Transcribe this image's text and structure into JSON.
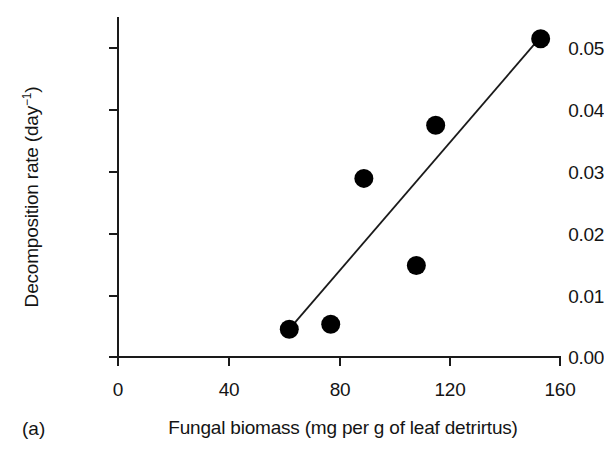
{
  "figure": {
    "panel_label": "(a)",
    "ylabel_text": "Decomposition rate (day",
    "ylabel_exponent": "−1",
    "ylabel_close": ")",
    "xlabel": "Fungal biomass (mg per g of leaf detrirtus)"
  },
  "chart_data": {
    "type": "scatter",
    "title": "",
    "xlabel": "Fungal biomass (mg per g of leaf detrirtus)",
    "ylabel": "Decomposition rate (day−1)",
    "xlim": [
      0,
      160
    ],
    "ylim": [
      0.0,
      0.05
    ],
    "xticks": [
      0,
      40,
      80,
      120,
      160
    ],
    "yticks": [
      0.0,
      0.01,
      0.02,
      0.03,
      0.04,
      0.05
    ],
    "xtick_labels": [
      "0",
      "40",
      "80",
      "120",
      "160"
    ],
    "ytick_labels": [
      "0.00",
      "0.01",
      "0.02",
      "0.03",
      "0.04",
      "0.05"
    ],
    "grid": false,
    "legend": "none",
    "marker": "filled-circle",
    "marker_color": "#000000",
    "points": [
      {
        "x": 62,
        "y": 0.0045
      },
      {
        "x": 77,
        "y": 0.0053
      },
      {
        "x": 89,
        "y": 0.0289
      },
      {
        "x": 108,
        "y": 0.0148
      },
      {
        "x": 115,
        "y": 0.0375
      },
      {
        "x": 153,
        "y": 0.0515
      }
    ],
    "x": [
      62,
      77,
      89,
      108,
      115,
      153
    ],
    "y": [
      0.0045,
      0.0053,
      0.0289,
      0.0148,
      0.0375,
      0.0515
    ],
    "fit_line": {
      "type": "linear-regression",
      "x_start": 62,
      "y_start": 0.0045,
      "x_end": 153,
      "y_end": 0.0518,
      "color": "#1a1a1a"
    },
    "axis_color": "#1a1a1a"
  }
}
